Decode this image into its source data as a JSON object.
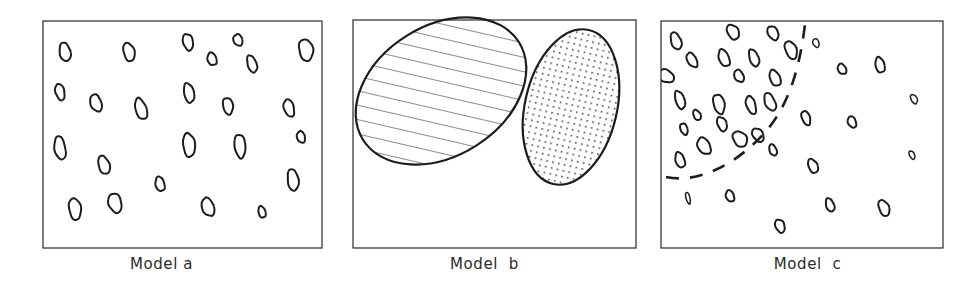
{
  "figure": {
    "background_color": "#ffffff",
    "ink_color": "#1c1c1c",
    "width": 969,
    "height": 293,
    "panel_count": 3
  },
  "panels": [
    {
      "id": "a",
      "caption": "Model a",
      "frame": {
        "x": 43,
        "y": 21,
        "width": 279,
        "height": 227
      },
      "description": "random uniform scatter of small open ellipses",
      "pattern": "random",
      "regions": [],
      "boundary_curve": null,
      "ellipses": [
        {
          "cx": 65,
          "cy": 52,
          "rx": 5.5,
          "ry": 9.5,
          "rot": -12
        },
        {
          "cx": 129,
          "cy": 52,
          "rx": 5.5,
          "ry": 9.5,
          "rot": -15
        },
        {
          "cx": 188,
          "cy": 42,
          "rx": 5.0,
          "ry": 8.5,
          "rot": -14
        },
        {
          "cx": 238,
          "cy": 40,
          "rx": 4.5,
          "ry": 6.0,
          "rot": -20
        },
        {
          "cx": 212,
          "cy": 59,
          "rx": 4.5,
          "ry": 6.5,
          "rot": -18
        },
        {
          "cx": 252,
          "cy": 64,
          "rx": 4.5,
          "ry": 9.0,
          "rot": -18
        },
        {
          "cx": 306,
          "cy": 50,
          "rx": 7.0,
          "ry": 11.0,
          "rot": -10
        },
        {
          "cx": 60,
          "cy": 92,
          "rx": 4.5,
          "ry": 8.5,
          "rot": -14
        },
        {
          "cx": 96,
          "cy": 103,
          "rx": 5.5,
          "ry": 9.0,
          "rot": -20
        },
        {
          "cx": 141,
          "cy": 109,
          "rx": 5.5,
          "ry": 11.0,
          "rot": -18
        },
        {
          "cx": 189,
          "cy": 93,
          "rx": 5.0,
          "ry": 10.0,
          "rot": -12
        },
        {
          "cx": 228,
          "cy": 106,
          "rx": 5.0,
          "ry": 8.5,
          "rot": -10
        },
        {
          "cx": 289,
          "cy": 108,
          "rx": 5.0,
          "ry": 9.0,
          "rot": -16
        },
        {
          "cx": 60,
          "cy": 148,
          "rx": 5.5,
          "ry": 12.0,
          "rot": -10
        },
        {
          "cx": 104,
          "cy": 165,
          "rx": 5.5,
          "ry": 9.5,
          "rot": -18
        },
        {
          "cx": 189,
          "cy": 145,
          "rx": 6.0,
          "ry": 12.0,
          "rot": -6
        },
        {
          "cx": 240,
          "cy": 146,
          "rx": 5.5,
          "ry": 12.0,
          "rot": -6
        },
        {
          "cx": 301,
          "cy": 137,
          "rx": 4.0,
          "ry": 6.0,
          "rot": -16
        },
        {
          "cx": 160,
          "cy": 184,
          "rx": 4.5,
          "ry": 7.5,
          "rot": -14
        },
        {
          "cx": 293,
          "cy": 180,
          "rx": 5.5,
          "ry": 11.0,
          "rot": -8
        },
        {
          "cx": 75,
          "cy": 209,
          "rx": 6.0,
          "ry": 11.0,
          "rot": -8
        },
        {
          "cx": 115,
          "cy": 203,
          "rx": 6.5,
          "ry": 10.0,
          "rot": -16
        },
        {
          "cx": 208,
          "cy": 207,
          "rx": 6.0,
          "ry": 9.5,
          "rot": -20
        },
        {
          "cx": 262,
          "cy": 212,
          "rx": 3.5,
          "ry": 6.0,
          "rot": -16
        }
      ]
    },
    {
      "id": "b",
      "caption": "Model  b",
      "frame": {
        "x": 30,
        "y": 20,
        "width": 283,
        "height": 228
      },
      "description": "two large clustered regions, one hatched and one stippled",
      "pattern": "clustered",
      "boundary_curve": null,
      "ellipses": [],
      "regions": [
        {
          "name": "hatched-region",
          "fill_style": "diagonal-hatch",
          "cx": 118,
          "cy": 91,
          "rx": 92,
          "ry": 65,
          "rot": -32,
          "hatch_spacing": 14,
          "hatch_angle": -45
        },
        {
          "name": "stippled-region",
          "fill_style": "dotted-stipple",
          "cx": 248,
          "cy": 107,
          "rx": 46,
          "ry": 79,
          "rot": 13,
          "dot_spacing": 6
        }
      ]
    },
    {
      "id": "c",
      "caption": "Model  c",
      "frame": {
        "x": 15,
        "y": 21,
        "width": 282,
        "height": 227
      },
      "description": "gradient of ellipse density, dense upper-left, sparse lower-right, separated by a dashed curve",
      "pattern": "gradient",
      "regions": [],
      "boundary_curve": {
        "name": "dashed-density-boundary",
        "style": "dashed",
        "dash_pattern": "13 11",
        "path": "M 20 177 C 52 184, 92 164, 121 130 C 150 96, 158 44, 161 2"
      },
      "ellipses": [
        {
          "cx": 30,
          "cy": 41,
          "rx": 5.0,
          "ry": 9.0,
          "rot": -20
        },
        {
          "cx": 87,
          "cy": 32,
          "rx": 5.5,
          "ry": 8.0,
          "rot": -30
        },
        {
          "cx": 127,
          "cy": 33,
          "rx": 5.0,
          "ry": 7.5,
          "rot": -28
        },
        {
          "cx": 46,
          "cy": 60,
          "rx": 4.5,
          "ry": 8.0,
          "rot": -30
        },
        {
          "cx": 78,
          "cy": 58,
          "rx": 5.0,
          "ry": 9.0,
          "rot": -22
        },
        {
          "cx": 108,
          "cy": 58,
          "rx": 4.5,
          "ry": 9.0,
          "rot": -20
        },
        {
          "cx": 145,
          "cy": 50,
          "rx": 5.5,
          "ry": 9.5,
          "rot": -22
        },
        {
          "cx": 20,
          "cy": 76,
          "rx": 6.0,
          "ry": 8.5,
          "rot": -62
        },
        {
          "cx": 93,
          "cy": 76,
          "rx": 4.5,
          "ry": 6.5,
          "rot": -28
        },
        {
          "cx": 129,
          "cy": 78,
          "rx": 5.0,
          "ry": 8.5,
          "rot": -24
        },
        {
          "cx": 34,
          "cy": 100,
          "rx": 4.5,
          "ry": 9.5,
          "rot": -18
        },
        {
          "cx": 73,
          "cy": 104,
          "rx": 5.5,
          "ry": 10.0,
          "rot": -14
        },
        {
          "cx": 105,
          "cy": 105,
          "rx": 4.5,
          "ry": 9.5,
          "rot": -18
        },
        {
          "cx": 124,
          "cy": 102,
          "rx": 5.0,
          "ry": 9.5,
          "rot": -24
        },
        {
          "cx": 51,
          "cy": 115,
          "rx": 3.5,
          "ry": 5.5,
          "rot": -26
        },
        {
          "cx": 76,
          "cy": 124,
          "rx": 4.5,
          "ry": 7.5,
          "rot": -22
        },
        {
          "cx": 38,
          "cy": 129,
          "rx": 3.5,
          "ry": 6.0,
          "rot": -20
        },
        {
          "cx": 58,
          "cy": 146,
          "rx": 6.0,
          "ry": 9.0,
          "rot": -30
        },
        {
          "cx": 34,
          "cy": 160,
          "rx": 4.5,
          "ry": 8.0,
          "rot": -18
        },
        {
          "cx": 94,
          "cy": 139,
          "rx": 6.5,
          "ry": 8.5,
          "rot": -38
        },
        {
          "cx": 112,
          "cy": 135,
          "rx": 5.0,
          "ry": 7.5,
          "rot": -34
        },
        {
          "cx": 170,
          "cy": 43,
          "rx": 3.0,
          "ry": 4.5,
          "rot": -20
        },
        {
          "cx": 196,
          "cy": 69,
          "rx": 4.0,
          "ry": 5.5,
          "rot": -30
        },
        {
          "cx": 234,
          "cy": 65,
          "rx": 4.5,
          "ry": 8.0,
          "rot": -14
        },
        {
          "cx": 268,
          "cy": 99,
          "rx": 3.0,
          "ry": 5.0,
          "rot": -28
        },
        {
          "cx": 160,
          "cy": 118,
          "rx": 4.0,
          "ry": 7.5,
          "rot": -20
        },
        {
          "cx": 206,
          "cy": 122,
          "rx": 4.0,
          "ry": 6.0,
          "rot": -22
        },
        {
          "cx": 127,
          "cy": 150,
          "rx": 3.5,
          "ry": 6.0,
          "rot": -22
        },
        {
          "cx": 167,
          "cy": 166,
          "rx": 4.5,
          "ry": 7.5,
          "rot": -24
        },
        {
          "cx": 266,
          "cy": 155,
          "rx": 2.5,
          "ry": 4.5,
          "rot": -26
        },
        {
          "cx": 42,
          "cy": 198,
          "rx": 2.0,
          "ry": 6.0,
          "rot": -14
        },
        {
          "cx": 84,
          "cy": 196,
          "rx": 4.0,
          "ry": 6.0,
          "rot": -22
        },
        {
          "cx": 184,
          "cy": 205,
          "rx": 4.0,
          "ry": 7.0,
          "rot": -20
        },
        {
          "cx": 238,
          "cy": 208,
          "rx": 5.0,
          "ry": 8.5,
          "rot": -22
        },
        {
          "cx": 134,
          "cy": 226,
          "rx": 4.5,
          "ry": 7.0,
          "rot": -22
        }
      ]
    }
  ]
}
